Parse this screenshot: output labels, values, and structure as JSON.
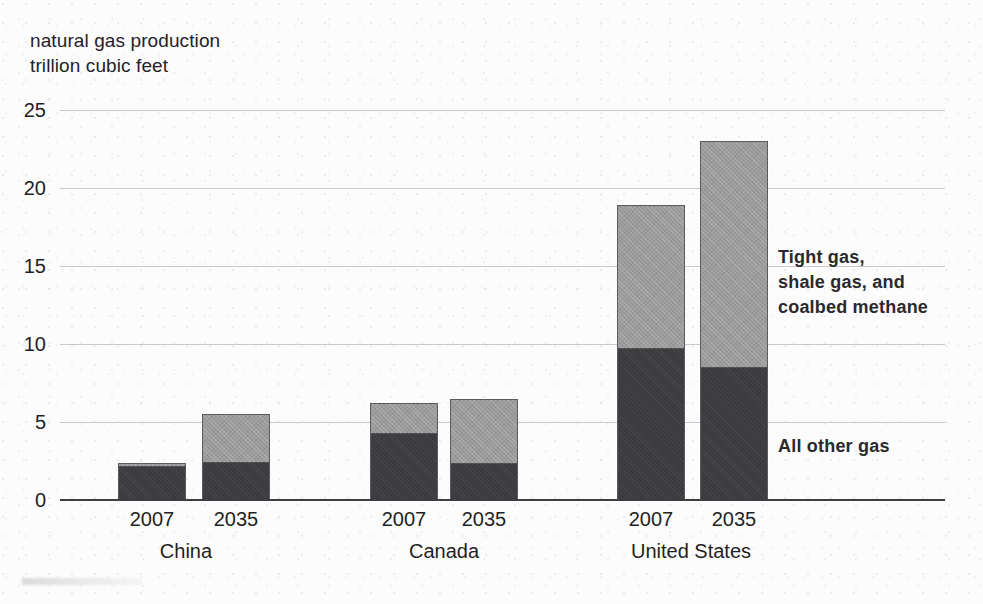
{
  "chart_data": {
    "type": "bar",
    "title": "",
    "ylabel": "natural gas production\ntrillion cubic feet",
    "xlabel": "",
    "ylim": [
      0,
      25
    ],
    "yticks": [
      0,
      5,
      10,
      15,
      20,
      25
    ],
    "grid": true,
    "stacked": true,
    "legend_position": "right-annotations",
    "categories": [
      "China 2007",
      "China 2035",
      "Canada 2007",
      "Canada 2035",
      "United States 2007",
      "United States 2035"
    ],
    "groups": [
      {
        "name": "China",
        "years": [
          "2007",
          "2035"
        ]
      },
      {
        "name": "Canada",
        "years": [
          "2007",
          "2035"
        ]
      },
      {
        "name": "United States",
        "years": [
          "2007",
          "2035"
        ]
      }
    ],
    "series": [
      {
        "name": "All other gas",
        "color": "#3b3b3e",
        "values": [
          2.2,
          2.4,
          4.3,
          2.3,
          9.7,
          8.5
        ]
      },
      {
        "name": "Tight gas, shale gas, and coalbed methane",
        "color": "#9b9b9b",
        "values": [
          0.2,
          3.1,
          1.9,
          4.2,
          9.2,
          14.5
        ]
      }
    ],
    "totals": [
      2.4,
      5.5,
      6.2,
      6.5,
      18.9,
      23.0
    ],
    "annotations": [
      {
        "id": "tight",
        "text": "Tight gas,\nshale gas, and\ncoalbed methane"
      },
      {
        "id": "other",
        "text": "All other gas"
      }
    ]
  },
  "axis": {
    "y_title": "natural gas production\ntrillion cubic feet",
    "ticks": [
      "25",
      "20",
      "15",
      "10",
      "5",
      "0"
    ]
  },
  "bars": [
    {
      "name": "china-2007",
      "year": "2007",
      "left": 58,
      "dark": 2.2,
      "light": 0.2
    },
    {
      "name": "china-2035",
      "year": "2035",
      "left": 142,
      "dark": 2.4,
      "light": 3.1
    },
    {
      "name": "canada-2007",
      "year": "2007",
      "left": 310,
      "dark": 4.3,
      "light": 1.9
    },
    {
      "name": "canada-2035",
      "year": "2035",
      "left": 390,
      "dark": 2.3,
      "light": 4.2
    },
    {
      "name": "us-2007",
      "year": "2007",
      "left": 557,
      "dark": 9.7,
      "light": 9.2
    },
    {
      "name": "us-2035",
      "year": "2035",
      "left": 640,
      "dark": 8.5,
      "light": 14.5
    }
  ],
  "groups": [
    {
      "name": "china",
      "label": "China",
      "center": 126
    },
    {
      "name": "canada",
      "label": "Canada",
      "center": 384
    },
    {
      "name": "us",
      "label": "United States",
      "center": 631
    }
  ],
  "callouts": {
    "tight": "Tight gas,\nshale gas, and\ncoalbed methane",
    "other": "All other gas"
  }
}
